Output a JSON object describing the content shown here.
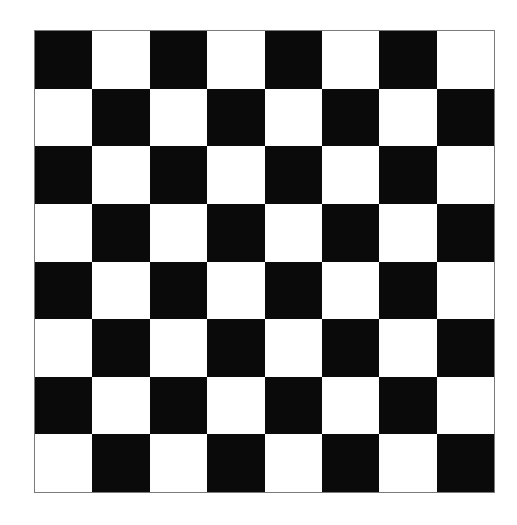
{
  "board": {
    "rows": 8,
    "cols": 8,
    "colors": {
      "dark": "#0a0a0a",
      "light": "#ffffff",
      "border": "#7a7a7a"
    },
    "top_left": "dark",
    "pattern": [
      [
        "dark",
        "light",
        "dark",
        "light",
        "dark",
        "light",
        "dark",
        "light"
      ],
      [
        "light",
        "dark",
        "light",
        "dark",
        "light",
        "dark",
        "light",
        "dark"
      ],
      [
        "dark",
        "light",
        "dark",
        "light",
        "dark",
        "light",
        "dark",
        "light"
      ],
      [
        "light",
        "dark",
        "light",
        "dark",
        "light",
        "dark",
        "light",
        "dark"
      ],
      [
        "dark",
        "light",
        "dark",
        "light",
        "dark",
        "light",
        "dark",
        "light"
      ],
      [
        "light",
        "dark",
        "light",
        "dark",
        "light",
        "dark",
        "light",
        "dark"
      ],
      [
        "dark",
        "light",
        "dark",
        "light",
        "dark",
        "light",
        "dark",
        "light"
      ],
      [
        "light",
        "dark",
        "light",
        "dark",
        "light",
        "dark",
        "light",
        "dark"
      ]
    ]
  }
}
